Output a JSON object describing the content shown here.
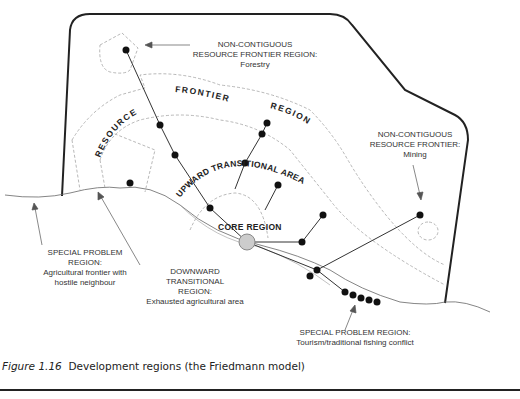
{
  "figure": {
    "caption_label": "Figure 1.16",
    "caption_text": "Development regions (the Friedmann model)"
  },
  "diagram": {
    "region_labels": {
      "resource": "RESOURCE",
      "frontier": "FRONTIER",
      "region": "REGION",
      "upward": "UPWARD TRANSITIONAL AREA",
      "core": "CORE REGION"
    },
    "callouts": {
      "forestry": {
        "line1": "NON-CONTIGUOUS",
        "line2": "RESOURCE FRONTIER REGION:",
        "line3": "Forestry"
      },
      "mining": {
        "line1": "NON-CONTIGUOUS",
        "line2": "RESOURCE FRONTIER:",
        "line3": "Mining"
      },
      "special_left": {
        "line1": "SPECIAL PROBLEM",
        "line2": "REGION:",
        "line3": "Agricultural frontier with",
        "line4": "hostile neighbour"
      },
      "downward": {
        "line1": "DOWNWARD",
        "line2": "TRANSITIONAL",
        "line3": "REGION:",
        "line4": "Exhausted agricultural area"
      },
      "special_bottom": {
        "line1": "SPECIAL PROBLEM REGION:",
        "line2": "Tourism/traditional fishing conflict"
      }
    }
  }
}
